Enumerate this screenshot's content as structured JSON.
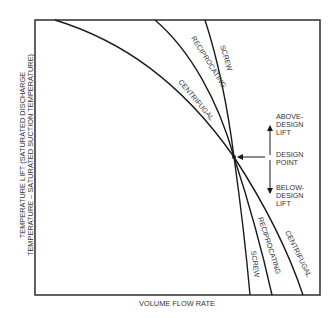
{
  "diagram": {
    "x_axis_label": "VOLUME FLOW RATE",
    "y_axis_label_line1": "TEMPERATURE LIFT (SATURATED DISCHARGE",
    "y_axis_label_line2": "TEMPERATURE – SATURATED SUCTION TEMPERATURE)",
    "curves": {
      "screw": {
        "label_upper": "SCREW",
        "label_lower": "SCREW"
      },
      "reciprocating": {
        "label_upper": "RECIPROCATING",
        "label_lower": "RECIPROCATING"
      },
      "centrifugal": {
        "label_upper": "CENTRIFUGAL",
        "label_lower": "CENTRIFUGAL"
      }
    },
    "annotations": {
      "above_line1": "ABOVE-",
      "above_line2": "DESIGN",
      "above_line3": "LIFT",
      "design_line1": "DESIGN",
      "design_line2": "POINT",
      "below_line1": "BELOW-",
      "below_line2": "DESIGN",
      "below_line3": "LIFT"
    },
    "colors": {
      "line": "#1a1a1a",
      "frame": "#3a3a3a",
      "text": "#333333",
      "background": "#ffffff"
    }
  }
}
